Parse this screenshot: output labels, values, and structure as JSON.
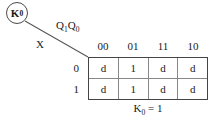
{
  "diagram": {
    "output_label": {
      "base": "K",
      "subscript": "0"
    },
    "column_variables": {
      "first_base": "Q",
      "first_sub": "1",
      "second_base": "Q",
      "second_sub": "0"
    },
    "row_variable": "X",
    "column_headers": [
      "00",
      "01",
      "11",
      "10"
    ],
    "row_headers": [
      "0",
      "1"
    ],
    "cells": [
      [
        "d",
        "1",
        "d",
        "d"
      ],
      [
        "d",
        "1",
        "d",
        "d"
      ]
    ],
    "caption": {
      "base": "K",
      "subscript": "0",
      "equation": "= 1"
    },
    "colors": {
      "ink": "#1a1a1a",
      "outer_border": "#444444",
      "inner_border": "#888888",
      "circle_stroke": "#4a4a4a",
      "line_stroke": "#555555",
      "background": "#ffffff"
    }
  }
}
